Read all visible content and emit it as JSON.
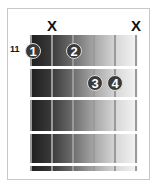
{
  "diagram": {
    "type": "guitar-chord-chart",
    "start_fret_label": "11",
    "strings": 6,
    "muted_marker": "X",
    "muted_strings": [
      2,
      6
    ],
    "fingers": [
      {
        "label": "1",
        "string": 1,
        "fret_row": 1
      },
      {
        "label": "2",
        "string": 3,
        "fret_row": 1
      },
      {
        "label": "3",
        "string": 4,
        "fret_row": 2
      },
      {
        "label": "4",
        "string": 5,
        "fret_row": 2
      }
    ]
  }
}
